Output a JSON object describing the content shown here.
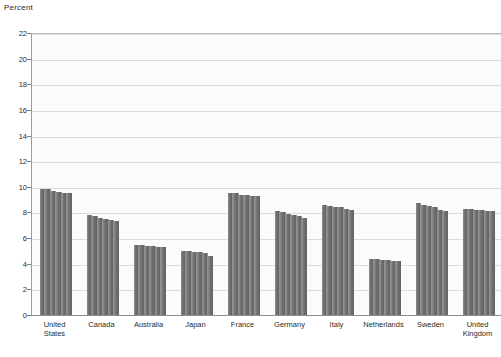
{
  "chart_data": {
    "type": "bar",
    "title": "",
    "subtitle": "",
    "xlabel": "",
    "ylabel": "Percent",
    "ylim": [
      0,
      22
    ],
    "ytick_labels": [
      "22",
      "20",
      "18",
      "16",
      "14",
      "12",
      "10",
      "8",
      "6",
      "4",
      "2",
      "0"
    ],
    "yticks": [
      22,
      20,
      18,
      16,
      14,
      12,
      10,
      8,
      6,
      4,
      2,
      0
    ],
    "grid": true,
    "legend": "none",
    "bar_color": "#6f6f6f",
    "plot_background": "#fbfbfb",
    "gridline_color": "#dcdcdc",
    "categories": [
      "United\nStates",
      "Canada",
      "Australia",
      "Japan",
      "France",
      "Germany",
      "Italy",
      "Netherlands",
      "Sweden",
      "United\nKingdom"
    ],
    "values": [
      9.7,
      7.6,
      5.4,
      4.9,
      9.4,
      7.9,
      8.4,
      4.3,
      8.5,
      8.2
    ],
    "groups": [
      {
        "category": "United\nStates",
        "bars": [
          9.8,
          9.8,
          9.7,
          9.6,
          9.5,
          9.5
        ]
      },
      {
        "category": "Canada",
        "bars": [
          7.8,
          7.7,
          7.6,
          7.5,
          7.4,
          7.3
        ]
      },
      {
        "category": "Australia",
        "bars": [
          5.5,
          5.5,
          5.4,
          5.4,
          5.3,
          5.3
        ]
      },
      {
        "category": "Japan",
        "bars": [
          5.0,
          5.0,
          4.9,
          4.9,
          4.8,
          4.6
        ]
      },
      {
        "category": "France",
        "bars": [
          9.5,
          9.5,
          9.4,
          9.4,
          9.3,
          9.3
        ]
      },
      {
        "category": "Germany",
        "bars": [
          8.1,
          8.0,
          7.9,
          7.8,
          7.7,
          7.6
        ]
      },
      {
        "category": "Italy",
        "bars": [
          8.6,
          8.5,
          8.4,
          8.4,
          8.3,
          8.2
        ]
      },
      {
        "category": "Netherlands",
        "bars": [
          4.4,
          4.4,
          4.3,
          4.3,
          4.2,
          4.2
        ]
      },
      {
        "category": "Sweden",
        "bars": [
          8.7,
          8.6,
          8.5,
          8.4,
          8.2,
          8.1
        ]
      },
      {
        "category": "United\nKingdom",
        "bars": [
          8.3,
          8.3,
          8.2,
          8.2,
          8.1,
          8.1
        ]
      }
    ]
  }
}
